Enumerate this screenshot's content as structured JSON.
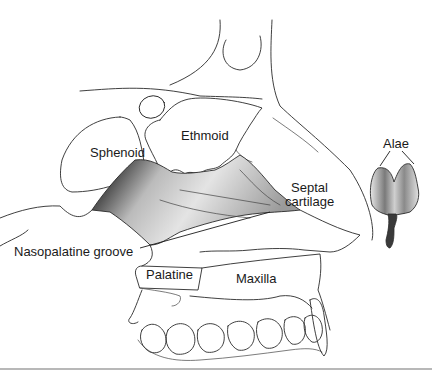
{
  "figure": {
    "labels": {
      "sphenoid": "Sphenoid",
      "ethmoid": "Ethmoid",
      "septal_line1": "Septal",
      "septal_line2": "cartilage",
      "nasopalatine": "Nasopalatine groove",
      "palatine": "Palatine",
      "maxilla": "Maxilla",
      "alae": "Alae"
    },
    "colors": {
      "line": "#2a2a2a",
      "shade_dark": "#3a3a3a",
      "shade_mid": "#8a8a8a",
      "shade_light": "#d6d6d6",
      "background": "#ffffff",
      "rule": "#b8b8b8"
    }
  }
}
